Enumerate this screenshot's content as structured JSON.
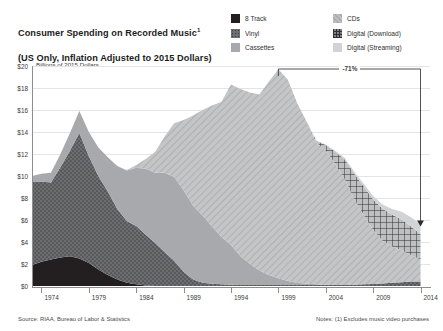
{
  "header": {
    "title_line1": "Consumer Spending on Recorded Music",
    "title_sup": "1",
    "title_line2": "(US Only, Inflation Adjusted to 2015 Dollars)"
  },
  "legend": {
    "col1": [
      {
        "label": "8 Track",
        "key": "8track",
        "color": "#231f20",
        "pattern": "solid"
      },
      {
        "label": "Vinyl",
        "key": "vinyl",
        "color": "#6d6e71",
        "pattern": "dots"
      },
      {
        "label": "Cassettes",
        "key": "cassettes",
        "color": "#a7a9ac",
        "pattern": "solid"
      }
    ],
    "col2": [
      {
        "label": "CDs",
        "key": "cds",
        "color": "#bcbec0",
        "pattern": "diagonal"
      },
      {
        "label": "Digital (Download)",
        "key": "download",
        "color": "#808285",
        "pattern": "crosshatch"
      },
      {
        "label": "Digital (Streaming)",
        "key": "streaming",
        "color": "#d1d3d4",
        "pattern": "solid"
      }
    ]
  },
  "axes": {
    "y_note": "Billions of 2015 Dollars",
    "y_ticks": [
      "$20",
      "$18",
      "$16",
      "$14",
      "$12",
      "$10",
      "$8",
      "$6",
      "$4",
      "$2",
      "$0"
    ],
    "y_min": 0,
    "y_max": 20,
    "x_ticks": [
      "1974",
      "1979",
      "1984",
      "1989",
      "1994",
      "1999",
      "2004",
      "2009",
      "2014"
    ],
    "x_min": 1973,
    "x_max": 2015
  },
  "annotation": {
    "label": "-71%",
    "from_year": 1999,
    "from_value": 19.1,
    "to_year": 2014,
    "to_value": 5.5
  },
  "footer": {
    "source": "Source: RIAA, Bureau of Labor & Statistics",
    "notes": "Notes: (1) Excludes music video purchases"
  },
  "chart_data": {
    "type": "area",
    "stacked": true,
    "xlabel": "",
    "ylabel": "Billions of 2015 Dollars",
    "xlim": [
      1973,
      2015
    ],
    "ylim": [
      0,
      20
    ],
    "grid": true,
    "legend_position": "top-right",
    "x": [
      1973,
      1974,
      1975,
      1976,
      1977,
      1978,
      1979,
      1980,
      1981,
      1982,
      1983,
      1984,
      1985,
      1986,
      1987,
      1988,
      1989,
      1990,
      1991,
      1992,
      1993,
      1994,
      1995,
      1996,
      1997,
      1998,
      1999,
      2000,
      2001,
      2002,
      2003,
      2004,
      2005,
      2006,
      2007,
      2008,
      2009,
      2010,
      2011,
      2012,
      2013,
      2014
    ],
    "series": [
      {
        "name": "8 Track",
        "color": "#231f20",
        "values": [
          1.9,
          2.2,
          2.4,
          2.6,
          2.7,
          2.5,
          2.1,
          1.5,
          1.0,
          0.6,
          0.3,
          0.15,
          0.05,
          0.0,
          0.0,
          0.0,
          0.0,
          0.0,
          0.0,
          0.0,
          0.0,
          0.0,
          0.0,
          0.0,
          0.0,
          0.0,
          0.0,
          0.0,
          0.0,
          0.0,
          0.0,
          0.0,
          0.0,
          0.0,
          0.0,
          0.0,
          0.0,
          0.0,
          0.0,
          0.0,
          0.0,
          0.0
        ]
      },
      {
        "name": "Vinyl",
        "color": "#6d6e71",
        "values": [
          7.6,
          7.3,
          7.0,
          8.2,
          9.6,
          11.4,
          9.7,
          8.5,
          7.6,
          6.4,
          5.6,
          5.3,
          4.6,
          3.9,
          3.1,
          2.3,
          1.3,
          0.6,
          0.3,
          0.2,
          0.15,
          0.12,
          0.1,
          0.1,
          0.1,
          0.1,
          0.1,
          0.1,
          0.1,
          0.1,
          0.1,
          0.1,
          0.1,
          0.1,
          0.12,
          0.15,
          0.18,
          0.22,
          0.3,
          0.35,
          0.4,
          0.42
        ]
      },
      {
        "name": "Cassettes",
        "color": "#a7a9ac",
        "values": [
          0.5,
          0.7,
          0.9,
          1.2,
          1.6,
          2.0,
          2.2,
          2.6,
          3.1,
          3.9,
          4.6,
          5.3,
          6.0,
          6.4,
          7.2,
          7.6,
          7.4,
          6.7,
          6.1,
          5.2,
          4.3,
          3.6,
          2.6,
          1.9,
          1.3,
          0.9,
          0.6,
          0.35,
          0.2,
          0.1,
          0.05,
          0.02,
          0.0,
          0.0,
          0.0,
          0.0,
          0.0,
          0.0,
          0.0,
          0.0,
          0.0,
          0.0
        ]
      },
      {
        "name": "CDs",
        "color": "#bcbec0",
        "values": [
          0.0,
          0.0,
          0.0,
          0.0,
          0.0,
          0.0,
          0.0,
          0.0,
          0.0,
          0.0,
          0.05,
          0.25,
          0.9,
          1.9,
          3.3,
          4.9,
          6.4,
          8.2,
          9.6,
          11.0,
          12.3,
          14.6,
          15.2,
          15.6,
          16.0,
          17.6,
          19.0,
          18.3,
          16.3,
          14.7,
          12.9,
          12.2,
          11.0,
          9.6,
          7.8,
          6.3,
          4.9,
          3.9,
          3.3,
          2.9,
          2.4,
          2.0
        ]
      },
      {
        "name": "Digital (Download)",
        "color": "#808285",
        "values": [
          0.0,
          0.0,
          0.0,
          0.0,
          0.0,
          0.0,
          0.0,
          0.0,
          0.0,
          0.0,
          0.0,
          0.0,
          0.0,
          0.0,
          0.0,
          0.0,
          0.0,
          0.0,
          0.0,
          0.0,
          0.0,
          0.0,
          0.0,
          0.0,
          0.0,
          0.0,
          0.0,
          0.0,
          0.0,
          0.0,
          0.15,
          0.5,
          1.1,
          1.8,
          2.3,
          2.6,
          2.8,
          2.9,
          2.9,
          2.8,
          2.6,
          2.3
        ]
      },
      {
        "name": "Digital (Streaming)",
        "color": "#d1d3d4",
        "values": [
          0.0,
          0.0,
          0.0,
          0.0,
          0.0,
          0.0,
          0.0,
          0.0,
          0.0,
          0.0,
          0.0,
          0.0,
          0.0,
          0.0,
          0.0,
          0.0,
          0.0,
          0.0,
          0.0,
          0.0,
          0.0,
          0.0,
          0.0,
          0.0,
          0.0,
          0.0,
          0.0,
          0.0,
          0.0,
          0.0,
          0.0,
          0.05,
          0.1,
          0.15,
          0.2,
          0.25,
          0.3,
          0.4,
          0.5,
          0.7,
          0.85,
          0.9
        ]
      }
    ],
    "annotations": [
      {
        "text": "-71%",
        "from": [
          1999,
          19.1
        ],
        "to": [
          2014,
          5.5
        ]
      }
    ]
  }
}
